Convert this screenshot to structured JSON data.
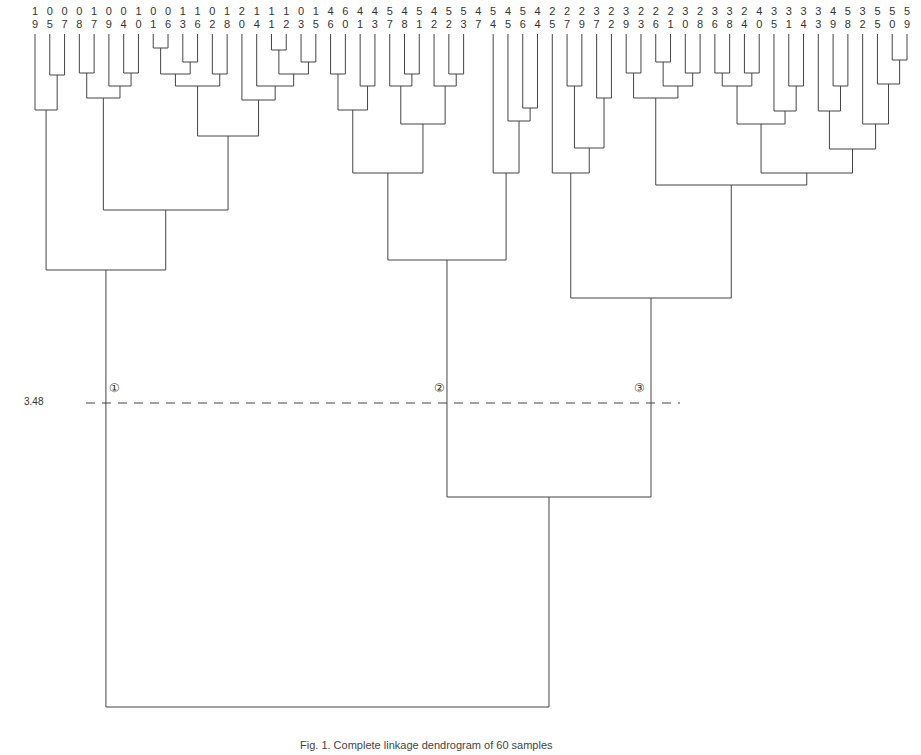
{
  "chart_data": {
    "type": "dendrogram",
    "title": "",
    "leaves": [
      "19",
      "05",
      "07",
      "08",
      "17",
      "09",
      "04",
      "10",
      "01",
      "06",
      "13",
      "16",
      "02",
      "18",
      "20",
      "14",
      "11",
      "12",
      "03",
      "15",
      "46",
      "60",
      "41",
      "43",
      "57",
      "48",
      "51",
      "42",
      "52",
      "53",
      "47",
      "54",
      "45",
      "56",
      "44",
      "25",
      "27",
      "29",
      "37",
      "22",
      "39",
      "23",
      "26",
      "21",
      "30",
      "28",
      "36",
      "38",
      "24",
      "40",
      "35",
      "31",
      "34",
      "33",
      "49",
      "58",
      "32",
      "55",
      "50",
      "59"
    ],
    "cut_level": {
      "value": "3.48",
      "label": "3.48"
    },
    "clusters": [
      {
        "id": "1",
        "symbol": "①",
        "leaves_from": "19",
        "leaves_to": "15"
      },
      {
        "id": "2",
        "symbol": "②",
        "leaves_from": "46",
        "leaves_to": "44"
      },
      {
        "id": "3",
        "symbol": "③",
        "leaves_from": "25",
        "leaves_to": "59"
      }
    ],
    "merges": [
      [
        1,
        2,
        100
      ],
      [
        0,
        -1,
        270
      ],
      [
        3,
        4,
        98
      ],
      [
        6,
        7,
        98
      ],
      [
        5,
        -3,
        142
      ],
      [
        -2,
        -4,
        178
      ],
      [
        -5,
        -6,
        210
      ],
      [
        8,
        9,
        22
      ],
      [
        10,
        11,
        65
      ],
      [
        -7,
        -8,
        100
      ],
      [
        12,
        13,
        101
      ],
      [
        -9,
        -10,
        135
      ],
      [
        16,
        17,
        22
      ],
      [
        18,
        19,
        66
      ],
      [
        -12,
        -13,
        100
      ],
      [
        15,
        -14,
        140
      ],
      [
        14,
        -15,
        177
      ],
      [
        -11,
        -16,
        233
      ],
      [
        -17,
        -18,
        395
      ],
      [
        -19,
        -20,
        470
      ]
    ]
  },
  "annotations": {
    "cut_label": "3.48",
    "cluster_1": "①",
    "cluster_2": "②",
    "cluster_3": "③"
  },
  "caption": "Fig. 1. Complete linkage dendrogram of 60 samples"
}
